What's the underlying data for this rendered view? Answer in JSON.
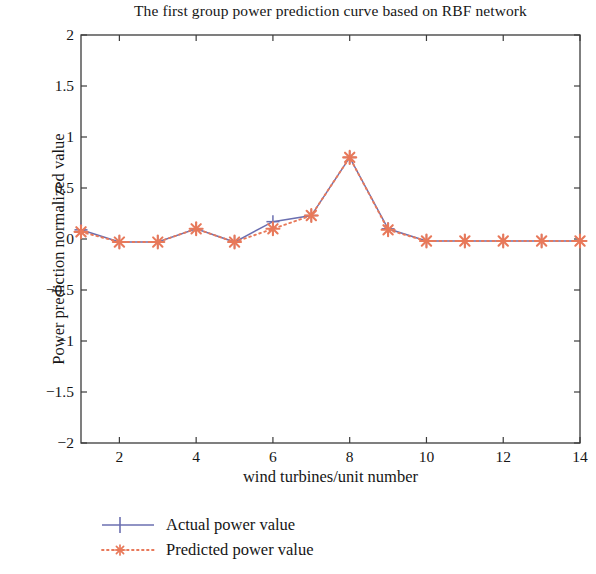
{
  "chart_data": {
    "type": "line",
    "title": "The first group power prediction curve based on RBF network",
    "xlabel": "wind turbines/unit number",
    "ylabel": "Power prediction normalized value",
    "x": [
      1,
      2,
      3,
      4,
      5,
      6,
      7,
      8,
      9,
      10,
      11,
      12,
      13,
      14
    ],
    "series": [
      {
        "name": "Actual power value",
        "color": "#6b6fb0",
        "linestyle": "solid",
        "marker": "plus",
        "values": [
          0.09,
          -0.03,
          -0.03,
          0.1,
          -0.03,
          0.17,
          0.23,
          0.8,
          0.1,
          -0.02,
          -0.02,
          -0.02,
          -0.02,
          -0.02
        ]
      },
      {
        "name": "Predicted power value",
        "color": "#e8795a",
        "linestyle": "dotted",
        "marker": "star",
        "values": [
          0.07,
          -0.03,
          -0.03,
          0.1,
          -0.03,
          0.1,
          0.23,
          0.8,
          0.09,
          -0.02,
          -0.02,
          -0.02,
          -0.02,
          -0.02
        ]
      }
    ],
    "xlim": [
      1,
      14
    ],
    "ylim": [
      -2,
      2
    ],
    "xticks": [
      2,
      4,
      6,
      8,
      10,
      12,
      14
    ],
    "yticks": [
      2,
      1.5,
      1,
      0.5,
      0,
      -0.5,
      -1,
      -1.5,
      -2
    ],
    "ytick_labels": [
      "2",
      "1.5",
      "1",
      "0.5",
      "0",
      "−0.5",
      "−1",
      "−1.5",
      "−2"
    ],
    "xtick_labels": [
      "2",
      "4",
      "6",
      "8",
      "10",
      "12",
      "14"
    ],
    "grid": false,
    "legend_position": "below-plot",
    "axis_color": "#3b3b3b",
    "background": "#ffffff"
  },
  "legend": {
    "items": [
      {
        "label": "Actual power value"
      },
      {
        "label": "Predicted power value"
      }
    ]
  }
}
